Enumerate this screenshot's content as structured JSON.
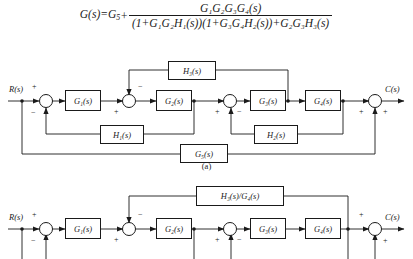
{
  "formula": {
    "lhs": "G(s)=G",
    "lhs_sub": "5",
    "plus": "+",
    "numerator": "G₁G₂G₃G₄(s)",
    "denominator": "(1+G₁G₂H₁(s))(1+G₃G₄H₂(s))+G₂G₃H₃(s)",
    "full_text": "G(s)=G₅ + G₁G₂G₃G₄(s) / ((1+G₁G₂H₁(s))(1+G₃G₄H₂(s))+G₂G₃H₃(s))"
  },
  "diagram_a": {
    "caption": "(a)",
    "input_label": "R(s)",
    "output_label": "C(s)",
    "blocks": [
      {
        "name": "G1",
        "label": "G₁(s)"
      },
      {
        "name": "G2",
        "label": "G₂(s)"
      },
      {
        "name": "G3",
        "label": "G₃(s)"
      },
      {
        "name": "G4",
        "label": "G₄(s)"
      },
      {
        "name": "G5",
        "label": "G₅(s)"
      },
      {
        "name": "H1",
        "label": "H₁(s)"
      },
      {
        "name": "H2",
        "label": "H₂(s)"
      },
      {
        "name": "H3",
        "label": "H₃(s)"
      }
    ],
    "summing_junctions": [
      {
        "name": "sum1",
        "signs": [
          "+",
          "−"
        ]
      },
      {
        "name": "sum2",
        "signs": [
          "+",
          "−"
        ]
      },
      {
        "name": "sum3",
        "signs": [
          "+",
          "−"
        ]
      },
      {
        "name": "sum4",
        "signs": [
          "+",
          "+"
        ]
      }
    ]
  },
  "diagram_b": {
    "input_label": "R(s)",
    "output_label": "C(s)",
    "blocks": [
      {
        "name": "G1",
        "label": "G₁(s)"
      },
      {
        "name": "G2",
        "label": "G₂(s)"
      },
      {
        "name": "G3",
        "label": "G₃(s)"
      },
      {
        "name": "G4",
        "label": "G₄(s)"
      },
      {
        "name": "H3G4",
        "label": "H₃(s)/G₄(s)"
      }
    ],
    "summing_junctions": [
      {
        "name": "sum1",
        "signs": [
          "+",
          "−"
        ]
      },
      {
        "name": "sum2",
        "signs": [
          "+",
          "−"
        ]
      },
      {
        "name": "sum3",
        "signs": [
          "+",
          "−"
        ]
      },
      {
        "name": "sum4",
        "signs": [
          "+",
          "+"
        ]
      }
    ]
  },
  "style": {
    "line_color": "#1a1a1a",
    "background": "#ffffff"
  }
}
